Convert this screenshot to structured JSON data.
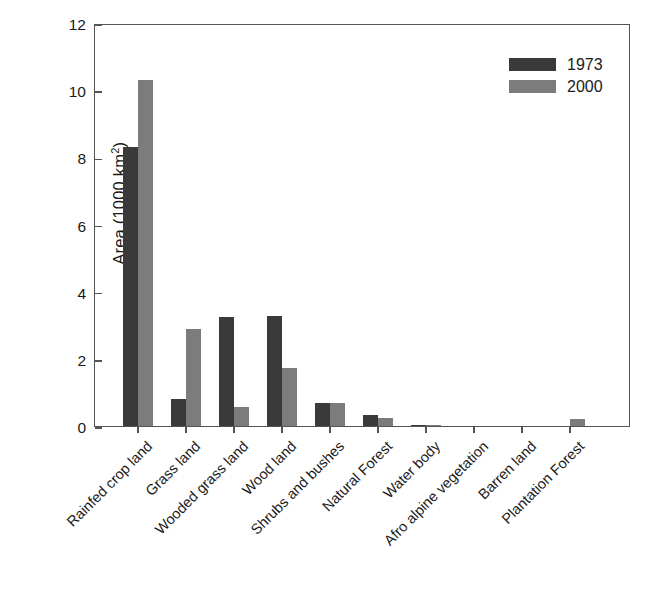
{
  "chart_data": {
    "type": "bar",
    "title": "",
    "xlabel": "",
    "ylabel": "Area (1000 km",
    "ylabel_sup": "2",
    "ylabel_suffix": ")",
    "ylim": [
      0,
      12
    ],
    "yticks": [
      0,
      2,
      4,
      6,
      8,
      10,
      12
    ],
    "grid": false,
    "legend_position": "top-right",
    "categories": [
      "Rainfed crop land",
      "Grass land",
      "Wooded grass land",
      "Wood land",
      "Shrubs and bushes",
      "Natural Forest",
      "Water body",
      "Afro alpine vegetation",
      "Barren land",
      "Plantation Forest"
    ],
    "series": [
      {
        "name": "1973",
        "color": "#3a3a3a",
        "values": [
          8.3,
          0.8,
          3.25,
          3.27,
          0.7,
          0.33,
          0.02,
          0.0,
          0.0,
          0.0
        ]
      },
      {
        "name": "2000",
        "color": "#7c7c7c",
        "values": [
          10.3,
          2.9,
          0.57,
          1.73,
          0.7,
          0.25,
          0.02,
          0.0,
          0.0,
          0.2
        ]
      }
    ]
  },
  "legend": {
    "entries": [
      {
        "label": "1973"
      },
      {
        "label": "2000"
      }
    ]
  }
}
